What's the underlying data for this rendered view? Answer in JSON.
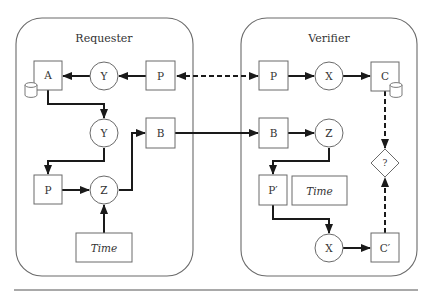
{
  "diagram": {
    "frames": [
      {
        "id": "requester",
        "title": "Requester"
      },
      {
        "id": "verifier",
        "title": "Verifier"
      }
    ],
    "requester": {
      "nodes": {
        "A": "A",
        "Y1": "Y",
        "P1": "P",
        "Y2": "Y",
        "B": "B",
        "P2": "P",
        "Z": "Z",
        "Time": "Time"
      }
    },
    "verifier": {
      "nodes": {
        "P": "P",
        "X1": "X",
        "C": "C",
        "B": "B",
        "Z": "Z",
        "Decision": "?",
        "Pprime": "P′",
        "Time": "Time",
        "X2": "X",
        "Cprime": "C′"
      }
    },
    "edges": [
      {
        "from": "verifier.P",
        "to": "requester.P",
        "style": "dashed",
        "bidirectional": true
      },
      {
        "from": "requester.P",
        "to": "requester.Y1",
        "style": "solid"
      },
      {
        "from": "requester.Y1",
        "to": "requester.A",
        "style": "solid"
      },
      {
        "from": "requester.A",
        "to": "requester.Y2",
        "style": "solid"
      },
      {
        "from": "requester.Y2",
        "to": "requester.P2",
        "style": "solid"
      },
      {
        "from": "requester.P2",
        "to": "requester.Z",
        "style": "solid"
      },
      {
        "from": "requester.Time",
        "to": "requester.Z",
        "style": "solid"
      },
      {
        "from": "requester.Z",
        "to": "requester.B",
        "style": "solid"
      },
      {
        "from": "requester.B",
        "to": "verifier.B",
        "style": "solid"
      },
      {
        "from": "verifier.P",
        "to": "verifier.X1",
        "style": "solid"
      },
      {
        "from": "verifier.X1",
        "to": "verifier.C",
        "style": "solid"
      },
      {
        "from": "verifier.C",
        "to": "verifier.Decision",
        "style": "dashed"
      },
      {
        "from": "verifier.B",
        "to": "verifier.Z",
        "style": "solid"
      },
      {
        "from": "verifier.Z",
        "to": "verifier.Pprime",
        "style": "solid"
      },
      {
        "from": "verifier.Pprime",
        "to": "verifier.X2",
        "style": "solid"
      },
      {
        "from": "verifier.X2",
        "to": "verifier.Cprime",
        "style": "solid"
      },
      {
        "from": "verifier.Cprime",
        "to": "verifier.Decision",
        "style": "dashed"
      }
    ],
    "storage_icons": [
      "database-on-A",
      "database-on-C"
    ]
  }
}
